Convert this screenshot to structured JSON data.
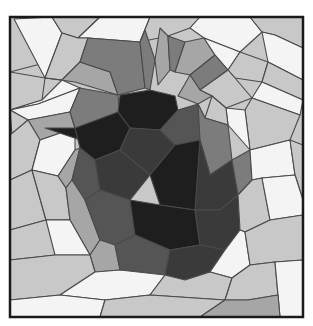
{
  "image": {
    "subject": "low-poly strawberry mosaic",
    "width": 313,
    "height": 326,
    "frame": {
      "x": 10,
      "y": 17,
      "w": 293,
      "h": 300,
      "stroke": "#1a1a1a"
    },
    "palette": {
      "white": "#f4f4f4",
      "light": "#c8c8c8",
      "mid": "#a6a6a6",
      "leaf": "#7c7c7c",
      "dark": "#555555",
      "darker": "#3a3a3a",
      "black": "#1e1e1e"
    },
    "polygons": [
      {
        "fill": "light",
        "points": "10,17 55,17 48,62 10,72"
      },
      {
        "fill": "white",
        "points": "14,19 52,17 62,33 45,78"
      },
      {
        "fill": "light",
        "points": "52,17 100,17 78,38 62,33"
      },
      {
        "fill": "white",
        "points": "100,17 150,17 140,42 88,38 78,38"
      },
      {
        "fill": "light",
        "points": "150,17 200,17 190,28 168,36 140,42"
      },
      {
        "fill": "white",
        "points": "200,17 250,17 262,32 240,52 204,38 190,28"
      },
      {
        "fill": "light",
        "points": "250,17 303,17 303,48 275,35 262,32"
      },
      {
        "fill": "white",
        "points": "275,35 303,48 303,80 268,62 262,32"
      },
      {
        "fill": "light",
        "points": "10,72 45,78 42,100 10,110"
      },
      {
        "fill": "light",
        "points": "45,78 62,33 78,38 88,38 80,62 62,80"
      },
      {
        "fill": "white",
        "points": "10,110 42,100 62,80 80,88 38,104"
      },
      {
        "fill": "mid",
        "points": "45,78 62,80 80,62 110,72 118,95 75,82"
      },
      {
        "fill": "leaf",
        "points": "88,38 140,42 145,88 118,95 110,72 80,62"
      },
      {
        "fill": "white",
        "points": "10,110 38,104 80,88 70,112 28,120"
      },
      {
        "fill": "light",
        "points": "10,110 28,120 12,135"
      },
      {
        "fill": "mid",
        "points": "28,120 70,112 75,128 40,140"
      },
      {
        "fill": "leaf",
        "points": "70,112 80,88 118,95 120,118 75,128"
      },
      {
        "fill": "light",
        "points": "10,135 28,120 40,140 32,170 10,180"
      },
      {
        "fill": "white",
        "points": "40,140 75,128 75,150 58,176 32,170"
      },
      {
        "fill": "black",
        "points": "45,128 75,128 110,120 95,145"
      },
      {
        "fill": "light",
        "points": "10,180 32,170 46,220 10,230"
      },
      {
        "fill": "light",
        "points": "32,170 58,176 66,188 70,220 46,220"
      },
      {
        "fill": "mid",
        "points": "58,176 75,150 80,148 72,180 66,188"
      },
      {
        "fill": "leaf",
        "points": "140,42 145,30 155,60 150,90 145,88"
      },
      {
        "fill": "mid",
        "points": "155,60 160,28 168,36 170,70 158,85"
      },
      {
        "fill": "leaf",
        "points": "168,36 185,42 175,72 170,70"
      },
      {
        "fill": "mid",
        "points": "185,42 204,38 215,55 190,75 175,72"
      },
      {
        "fill": "white",
        "points": "204,38 240,52 228,70 215,55"
      },
      {
        "fill": "light",
        "points": "240,52 268,62 262,82 235,78 228,70"
      },
      {
        "fill": "light",
        "points": "268,62 303,80 303,100 262,82"
      },
      {
        "fill": "leaf",
        "points": "215,55 228,70 200,90 190,75"
      },
      {
        "fill": "light",
        "points": "228,70 235,78 252,98 226,108 212,96 200,90"
      },
      {
        "fill": "mid",
        "points": "190,75 200,90 212,96 198,104 178,96"
      },
      {
        "fill": "white",
        "points": "262,82 303,100 300,115 252,98"
      },
      {
        "fill": "light",
        "points": "252,98 300,115 290,140 250,150 245,110"
      },
      {
        "fill": "white",
        "points": "245,110 250,150 228,125 226,108"
      },
      {
        "fill": "light",
        "points": "212,96 226,108 228,125 205,118"
      },
      {
        "fill": "black",
        "points": "120,95 150,90 175,96 178,110 160,130 130,128 118,112"
      },
      {
        "fill": "black",
        "points": "75,128 118,112 130,128 120,150 95,160 80,148"
      },
      {
        "fill": "darker",
        "points": "130,128 160,130 175,145 150,175 120,150"
      },
      {
        "fill": "dark",
        "points": "160,130 178,110 198,104 205,118 200,140 175,145"
      },
      {
        "fill": "leaf",
        "points": "198,104 205,118 228,125 232,160 210,175 200,140"
      },
      {
        "fill": "dark",
        "points": "80,148 95,160 100,190 85,200 72,180"
      },
      {
        "fill": "darker",
        "points": "95,160 120,150 150,175 130,200 100,190"
      },
      {
        "fill": "black",
        "points": "150,175 175,145 200,140 210,175 195,210 160,205"
      },
      {
        "fill": "darker",
        "points": "200,140 210,175 232,160 238,195 220,210 195,210"
      },
      {
        "fill": "leaf",
        "points": "232,160 250,150 252,180 238,195"
      },
      {
        "fill": "white",
        "points": "250,150 290,140 295,175 262,178 252,180"
      },
      {
        "fill": "light",
        "points": "290,140 303,145 303,200 295,175"
      },
      {
        "fill": "mid",
        "points": "72,180 85,200 100,240 90,255 70,220 66,188"
      },
      {
        "fill": "dark",
        "points": "85,200 100,190 130,200 135,235 115,245 100,240"
      },
      {
        "fill": "black",
        "points": "130,200 160,205 195,210 200,245 170,250 135,235"
      },
      {
        "fill": "darker",
        "points": "195,210 220,210 238,195 240,230 225,250 200,245"
      },
      {
        "fill": "light",
        "points": "238,195 252,180 262,178 270,220 245,232 240,230"
      },
      {
        "fill": "white",
        "points": "262,178 295,175 303,200 303,215 270,220"
      },
      {
        "fill": "light",
        "points": "10,230 46,220 70,220 55,255 10,260"
      },
      {
        "fill": "white",
        "points": "46,220 70,220 90,255 55,255"
      },
      {
        "fill": "mid",
        "points": "90,255 100,240 115,245 120,270 95,272"
      },
      {
        "fill": "dark",
        "points": "115,245 135,235 170,250 165,275 120,270"
      },
      {
        "fill": "darker",
        "points": "170,250 200,245 225,250 210,272 185,280 165,275"
      },
      {
        "fill": "white",
        "points": "225,250 240,230 245,232 250,265 232,278 210,272"
      },
      {
        "fill": "light",
        "points": "245,232 270,220 303,215 303,260 275,262 250,265"
      },
      {
        "fill": "light",
        "points": "10,260 55,255 90,255 95,272 60,295 10,300"
      },
      {
        "fill": "white",
        "points": "60,295 95,272 120,270 165,275 150,295 105,300"
      },
      {
        "fill": "light",
        "points": "165,275 185,280 210,272 232,278 225,300 150,295"
      },
      {
        "fill": "light",
        "points": "232,278 250,265 275,262 278,295 248,300 225,300"
      },
      {
        "fill": "white",
        "points": "275,262 303,260 303,317 280,317 278,295"
      },
      {
        "fill": "white",
        "points": "10,300 60,295 105,300 100,317 10,317"
      },
      {
        "fill": "light",
        "points": "105,300 150,295 225,300 200,317 100,317"
      },
      {
        "fill": "mid",
        "points": "225,300 248,300 278,295 280,317 200,317"
      }
    ]
  }
}
